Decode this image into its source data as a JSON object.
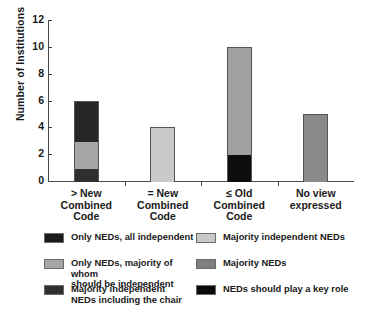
{
  "chart_data": {
    "type": "bar",
    "subtype": "stacked-bar",
    "title": "",
    "xlabel": "",
    "ylabel": "Number of Institutions",
    "ylim": [
      0,
      12
    ],
    "yticks": [
      0,
      2,
      4,
      6,
      8,
      10,
      12
    ],
    "grid": false,
    "legend_position": "below",
    "categories": [
      "> New\nCombined\nCode",
      "= New\nCombined\nCode",
      "≤ Old\nCombined\nCode",
      "No view\nexpressed"
    ],
    "category_lines": [
      [
        "> New",
        "Combined",
        "Code"
      ],
      [
        "= New",
        "Combined",
        "Code"
      ],
      [
        "≤ Old",
        "Combined",
        "Code"
      ],
      [
        "No view",
        "expressed"
      ]
    ],
    "totals": [
      6,
      4,
      10,
      5
    ],
    "series": [
      {
        "name": "Only NEDs, all independent",
        "color": "#1a1a1a",
        "values": [
          0,
          0,
          2,
          0
        ]
      },
      {
        "name": "Majority independent NEDs",
        "color": "#c9c9c9",
        "values": [
          0,
          4,
          0,
          0
        ]
      },
      {
        "name": "Only NEDs, majority of whom should be independent",
        "color": "#a6a6a6",
        "values": [
          2,
          0,
          0,
          0
        ]
      },
      {
        "name": "Majority NEDs",
        "color": "#7e7e7e",
        "values": [
          0,
          0,
          8,
          5
        ]
      },
      {
        "name": "Majority independent NEDs including the chair",
        "color": "#2f2f2f",
        "values": [
          1,
          0,
          0,
          0
        ]
      },
      {
        "name": "NEDs should play a key role",
        "color": "#0a0a0a",
        "values": [
          3,
          0,
          0,
          0
        ]
      }
    ],
    "bars": [
      {
        "category": "> New Combined Code",
        "total": 6,
        "segments": [
          {
            "label": "Majority independent NEDs including the chair",
            "from": 0,
            "to": 1,
            "value": 1,
            "color": "#2f2f2f"
          },
          {
            "label": "Only NEDs, majority of whom should be independent",
            "from": 1,
            "to": 3,
            "value": 2,
            "color": "#a6a6a6"
          },
          {
            "label": "NEDs should play a key role",
            "from": 3,
            "to": 6,
            "value": 3,
            "color": "#262626"
          }
        ]
      },
      {
        "category": "= New Combined Code",
        "total": 4,
        "segments": [
          {
            "label": "Majority independent NEDs",
            "from": 0,
            "to": 4,
            "value": 4,
            "color": "#c9c9c9"
          }
        ]
      },
      {
        "category": "≤ Old Combined Code",
        "total": 10,
        "segments": [
          {
            "label": "Only NEDs, all independent",
            "from": 0,
            "to": 2,
            "value": 2,
            "color": "#0d0d0d"
          },
          {
            "label": "Majority NEDs",
            "from": 2,
            "to": 10,
            "value": 8,
            "color": "#a0a0a0"
          }
        ]
      },
      {
        "category": "No view expressed",
        "total": 5,
        "segments": [
          {
            "label": "Majority NEDs",
            "from": 0,
            "to": 5,
            "value": 5,
            "color": "#8a8a8a"
          }
        ]
      }
    ]
  },
  "legend": {
    "left_column": [
      {
        "swatch": "#1a1a1a",
        "lines": [
          "Only NEDs, all independent"
        ]
      },
      {
        "swatch": "#a6a6a6",
        "lines": [
          "Only NEDs, majority of whom",
          "should be independent"
        ]
      },
      {
        "swatch": "#2f2f2f",
        "lines": [
          "Majority independent",
          "NEDs including the chair"
        ]
      }
    ],
    "right_column": [
      {
        "swatch": "#c9c9c9",
        "lines": [
          "Majority independent NEDs"
        ]
      },
      {
        "swatch": "#7e7e7e",
        "lines": [
          "Majority NEDs"
        ]
      },
      {
        "swatch": "#0a0a0a",
        "lines": [
          "NEDs should play a key role"
        ]
      }
    ]
  }
}
